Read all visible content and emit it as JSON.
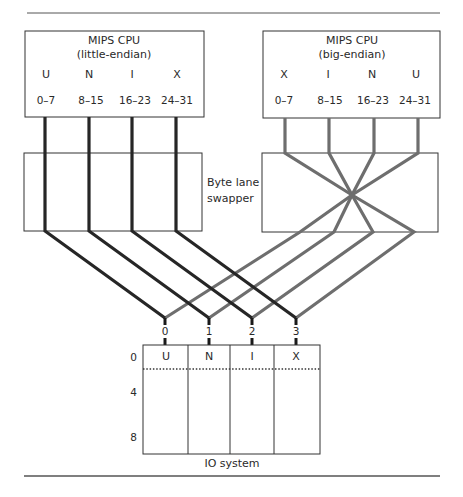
{
  "diagram": {
    "left_cpu": {
      "title": "MIPS CPU",
      "subtitle": "(little-endian)",
      "bytes": [
        "U",
        "N",
        "I",
        "X"
      ],
      "lanes": [
        "0–7",
        "8–15",
        "16–23",
        "24–31"
      ]
    },
    "right_cpu": {
      "title": "MIPS CPU",
      "subtitle": "(big-endian)",
      "bytes": [
        "X",
        "I",
        "N",
        "U"
      ],
      "lanes": [
        "0–7",
        "8–15",
        "16–23",
        "24–31"
      ]
    },
    "swapper": {
      "label_line1": "Byte lane",
      "label_line2": "swapper"
    },
    "io": {
      "ports": [
        "0",
        "1",
        "2",
        "3"
      ],
      "bytes": [
        "U",
        "N",
        "I",
        "X"
      ],
      "row_offsets": [
        "0",
        "4",
        "8"
      ],
      "label": "IO system"
    },
    "colors": {
      "little_endian_wire": "#262626",
      "big_endian_wire": "#6e6e6e",
      "box_stroke": "#333333"
    }
  }
}
